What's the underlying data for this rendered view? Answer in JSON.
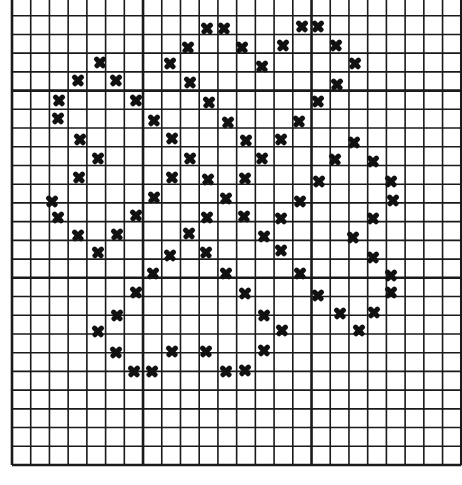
{
  "pattern": {
    "title": "",
    "grid": {
      "origin_x": 12,
      "origin_y": -3,
      "cell": 18.72,
      "cols": 24,
      "rows": 25,
      "major_every": 7,
      "line_color": "#1a1a1a",
      "major_columns": [
        7,
        16
      ],
      "major_rows": [
        5,
        15
      ]
    },
    "stitch_symbol": "X",
    "stitch_color": "#111111",
    "marks": [
      [
        207,
        28
      ],
      [
        224,
        28
      ],
      [
        302,
        26
      ],
      [
        318,
        26
      ],
      [
        188,
        47
      ],
      [
        242,
        47
      ],
      [
        283,
        45
      ],
      [
        336,
        45
      ],
      [
        100,
        62
      ],
      [
        170,
        63
      ],
      [
        262,
        66
      ],
      [
        355,
        63
      ],
      [
        78,
        80
      ],
      [
        116,
        80
      ],
      [
        190,
        82
      ],
      [
        337,
        84
      ],
      [
        59,
        100
      ],
      [
        136,
        100
      ],
      [
        209,
        102
      ],
      [
        318,
        101
      ],
      [
        58,
        118
      ],
      [
        154,
        120
      ],
      [
        228,
        122
      ],
      [
        299,
        121
      ],
      [
        80,
        139
      ],
      [
        172,
        138
      ],
      [
        246,
        140
      ],
      [
        281,
        139
      ],
      [
        354,
        142
      ],
      [
        98,
        158
      ],
      [
        190,
        158
      ],
      [
        262,
        158
      ],
      [
        335,
        159
      ],
      [
        373,
        161
      ],
      [
        79,
        177
      ],
      [
        172,
        177
      ],
      [
        208,
        179
      ],
      [
        245,
        178
      ],
      [
        319,
        181
      ],
      [
        391,
        181
      ],
      [
        52,
        201
      ],
      [
        154,
        197
      ],
      [
        226,
        198
      ],
      [
        300,
        201
      ],
      [
        393,
        200
      ],
      [
        58,
        217
      ],
      [
        136,
        215
      ],
      [
        207,
        217
      ],
      [
        244,
        216
      ],
      [
        281,
        218
      ],
      [
        373,
        218
      ],
      [
        78,
        235
      ],
      [
        117,
        234
      ],
      [
        189,
        233
      ],
      [
        264,
        236
      ],
      [
        353,
        237
      ],
      [
        98,
        252
      ],
      [
        170,
        255
      ],
      [
        206,
        252
      ],
      [
        281,
        250
      ],
      [
        373,
        257
      ],
      [
        153,
        273
      ],
      [
        226,
        273
      ],
      [
        300,
        273
      ],
      [
        391,
        275
      ],
      [
        136,
        292
      ],
      [
        318,
        295
      ],
      [
        391,
        292
      ],
      [
        117,
        315
      ],
      [
        245,
        293
      ],
      [
        264,
        315
      ],
      [
        340,
        313
      ],
      [
        374,
        312
      ],
      [
        98,
        331
      ],
      [
        282,
        330
      ],
      [
        359,
        330
      ],
      [
        116,
        352
      ],
      [
        172,
        351
      ],
      [
        206,
        351
      ],
      [
        264,
        350
      ],
      [
        134,
        371
      ],
      [
        152,
        371
      ],
      [
        226,
        371
      ],
      [
        245,
        370
      ]
    ]
  }
}
